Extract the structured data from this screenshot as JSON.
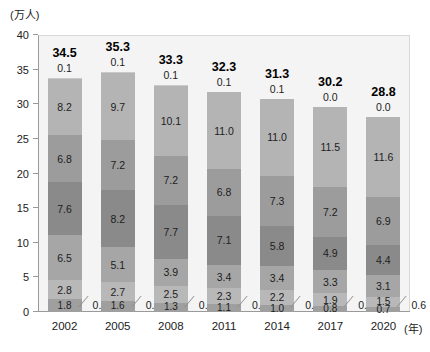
{
  "chart_data": {
    "type": "bar",
    "subtype": "stacked-bar",
    "title": "",
    "xlabel": "(年)",
    "ylabel": "(万人)",
    "ylim": [
      0,
      40
    ],
    "yticks": [
      "0",
      "5",
      "10",
      "15",
      "20",
      "25",
      "30",
      "35",
      "40"
    ],
    "grid": false,
    "legend": "none",
    "categories": [
      "2002",
      "2005",
      "2008",
      "2011",
      "2014",
      "2017",
      "2020"
    ],
    "totals": [
      "34.5",
      "35.3",
      "33.3",
      "32.3",
      "31.3",
      "30.2",
      "28.8"
    ],
    "stack_order": "top-to-bottom",
    "series": [
      {
        "name": "segment-1",
        "values": [
          0.1,
          0.1,
          0.1,
          0.1,
          0.1,
          0.0,
          0.0
        ],
        "labels": [
          "0.1",
          "0.1",
          "0.1",
          "0.1",
          "0.1",
          "0.0",
          "0.0"
        ]
      },
      {
        "name": "segment-2",
        "values": [
          8.2,
          9.7,
          10.1,
          11.0,
          11.0,
          11.5,
          11.6
        ],
        "labels": [
          "8.2",
          "9.7",
          "10.1",
          "11.0",
          "11.0",
          "11.5",
          "11.6"
        ]
      },
      {
        "name": "segment-3",
        "values": [
          6.8,
          7.2,
          7.2,
          6.8,
          7.3,
          7.2,
          6.9
        ],
        "labels": [
          "6.8",
          "7.2",
          "7.2",
          "6.8",
          "7.3",
          "7.2",
          "6.9"
        ]
      },
      {
        "name": "segment-4",
        "values": [
          7.6,
          8.2,
          7.7,
          7.1,
          5.8,
          4.9,
          4.4
        ],
        "labels": [
          "7.6",
          "8.2",
          "7.7",
          "7.1",
          "5.8",
          "4.9",
          "4.4"
        ]
      },
      {
        "name": "segment-5",
        "values": [
          6.5,
          5.1,
          3.9,
          3.4,
          3.4,
          3.3,
          3.1
        ],
        "labels": [
          "6.5",
          "5.1",
          "3.9",
          "3.4",
          "3.4",
          "3.3",
          "3.1"
        ]
      },
      {
        "name": "segment-6",
        "values": [
          2.8,
          2.7,
          2.5,
          2.3,
          2.2,
          1.9,
          1.5
        ],
        "labels": [
          "2.8",
          "2.7",
          "2.5",
          "2.3",
          "2.2",
          "1.9",
          "1.5"
        ]
      },
      {
        "name": "segment-7",
        "values": [
          1.8,
          1.6,
          1.3,
          1.1,
          1.0,
          0.8,
          0.7
        ],
        "labels": [
          "1.8",
          "1.6",
          "1.3",
          "1.1",
          "1.0",
          "0.8",
          "0.7"
        ]
      },
      {
        "name": "segment-8",
        "values": [
          0.8,
          0.7,
          0.6,
          0.6,
          0.6,
          0.5,
          0.6
        ],
        "labels": [
          "0.8",
          "0.7",
          "0.6",
          "0.6",
          "0.6",
          "0.5",
          "0.6"
        ]
      }
    ],
    "segment_colors": [
      "#c9c9c9",
      "#b4b4b4",
      "#9c9c9c",
      "#8a8a8a",
      "#a6a6a6",
      "#b8b8b8",
      "#9f9f9f",
      "#c4c4c4"
    ],
    "plot_background": "#f4f4f4",
    "axis_color": "#9a9a9a",
    "text_color": "#1d1d1d"
  },
  "axis": {
    "y_unit": "(万人)",
    "x_unit": "(年)"
  }
}
